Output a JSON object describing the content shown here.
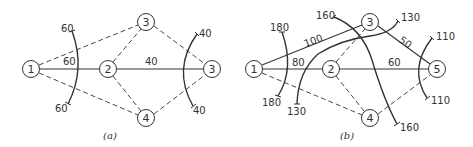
{
  "diagram_a": {
    "caption": "(a)",
    "nodes": [
      {
        "id": "n1",
        "label": "1",
        "x": 31,
        "y": 69
      },
      {
        "id": "n2",
        "label": "2",
        "x": 108,
        "y": 69
      },
      {
        "id": "n3top",
        "label": "3",
        "x": 146,
        "y": 22
      },
      {
        "id": "n3right",
        "label": "3",
        "x": 212,
        "y": 69
      },
      {
        "id": "n4",
        "label": "4",
        "x": 146,
        "y": 118
      }
    ],
    "edges": [
      {
        "from": "1",
        "to": "2",
        "style": "solid",
        "label": "60"
      },
      {
        "from": "2",
        "to": "3 (right)",
        "style": "solid",
        "label": "40"
      },
      {
        "from": "1",
        "to": "3 (top)",
        "style": "dashed"
      },
      {
        "from": "1",
        "to": "4",
        "style": "dashed"
      },
      {
        "from": "2",
        "to": "3 (top)",
        "style": "dashed"
      },
      {
        "from": "2",
        "to": "4",
        "style": "dashed"
      },
      {
        "from": "3 (top)",
        "to": "3 (right)",
        "style": "dashed"
      },
      {
        "from": "4",
        "to": "3 (right)",
        "style": "dashed"
      }
    ],
    "cuts": [
      {
        "name": "left-cut",
        "end_labels": [
          "60",
          "60"
        ],
        "crossing_label": "60"
      },
      {
        "name": "right-cut",
        "end_labels": [
          "40",
          "40"
        ],
        "crossing_label": "40"
      }
    ],
    "labels": {
      "cut_left_top": "60",
      "edge_1_2": "60",
      "cut_left_bottom": "60",
      "cut_right_top": "40",
      "edge_2_3": "40",
      "cut_right_bottom": "40"
    }
  },
  "diagram_b": {
    "caption": "(b)",
    "nodes": [
      {
        "id": "n1",
        "label": "1",
        "x": 254,
        "y": 69
      },
      {
        "id": "n2",
        "label": "2",
        "x": 331,
        "y": 69
      },
      {
        "id": "n3",
        "label": "3",
        "x": 370,
        "y": 22
      },
      {
        "id": "n4",
        "label": "4",
        "x": 370,
        "y": 118
      },
      {
        "id": "n5",
        "label": "5",
        "x": 437,
        "y": 69
      }
    ],
    "edges": [
      {
        "from": "1",
        "to": "2",
        "style": "solid",
        "label": "80"
      },
      {
        "from": "1",
        "to": "3",
        "style": "solid",
        "label": "100"
      },
      {
        "from": "2",
        "to": "5",
        "style": "solid",
        "label": "60"
      },
      {
        "from": "3",
        "to": "5",
        "style": "solid",
        "label": "50"
      },
      {
        "from": "1",
        "to": "4",
        "style": "dashed"
      },
      {
        "from": "2",
        "to": "3",
        "style": "dashed"
      },
      {
        "from": "2",
        "to": "4",
        "style": "dashed"
      },
      {
        "from": "4",
        "to": "5",
        "style": "dashed"
      }
    ],
    "cuts": [
      {
        "name": "cut-180",
        "end_labels": [
          "180",
          "180"
        ]
      },
      {
        "name": "cut-130",
        "end_labels": [
          "130",
          "130"
        ]
      },
      {
        "name": "cut-160",
        "end_labels": [
          "160",
          "160"
        ]
      },
      {
        "name": "cut-110",
        "end_labels": [
          "110",
          "110"
        ]
      }
    ],
    "labels": {
      "cut180_top": "180",
      "cut180_bottom": "180",
      "edge_1_3": "100",
      "edge_1_2": "80",
      "edge_2_5": "60",
      "edge_3_5": "50",
      "cut160_top": "160",
      "cut160_bottom": "160",
      "cut130_top": "130",
      "cut130_bottom": "130",
      "cut110_top": "110",
      "cut110_bottom": "110"
    }
  }
}
